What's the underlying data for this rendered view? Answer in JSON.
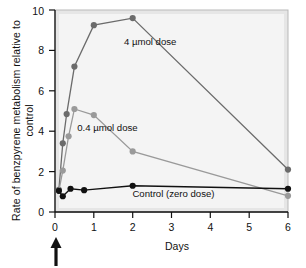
{
  "chart_data": {
    "type": "line",
    "title": "",
    "xlabel": "Days",
    "ylabel": "Rate of benzpyrene metabolism relative to control",
    "xlim": [
      0,
      6
    ],
    "ylim": [
      0,
      10
    ],
    "xticks": [
      "0",
      "1",
      "2",
      "3",
      "4",
      "5",
      "6"
    ],
    "xtick_values": [
      0,
      1,
      2,
      3,
      4,
      5,
      6
    ],
    "yticks": [
      "0",
      "2",
      "4",
      "6",
      "8",
      "10"
    ],
    "ytick_values": [
      0,
      2,
      4,
      6,
      8,
      10
    ],
    "grid": false,
    "legend_position": "inline-annotations",
    "series": [
      {
        "name": "4 µmol dose",
        "color": "#6b6b6b",
        "marker": "circle",
        "x": [
          0.1,
          0.2,
          0.3,
          0.5,
          1.0,
          2.0,
          6.0
        ],
        "y": [
          1.1,
          3.4,
          4.85,
          7.2,
          9.25,
          9.6,
          2.1
        ]
      },
      {
        "name": "0.4 µmol dose",
        "color": "#9a9a9a",
        "marker": "circle",
        "x": [
          0.1,
          0.2,
          0.35,
          0.5,
          1.0,
          2.0,
          6.0
        ],
        "y": [
          1.05,
          2.05,
          3.75,
          5.1,
          4.8,
          3.0,
          0.8
        ]
      },
      {
        "name": "Control (zero dose)",
        "color": "#111111",
        "marker": "circle",
        "x": [
          0.1,
          0.2,
          0.4,
          0.75,
          2.0,
          6.0
        ],
        "y": [
          1.05,
          0.78,
          1.15,
          1.08,
          1.3,
          1.15
        ]
      }
    ],
    "annotations": [
      {
        "text": "4 µmol dose",
        "x": 2.45,
        "y": 8.25
      },
      {
        "text": "0.4 µmol dose",
        "x": 1.35,
        "y": 4.0
      },
      {
        "text": "Control (zero dose)",
        "x": 3.05,
        "y": 0.72
      }
    ],
    "markers": [
      {
        "name": "dose-arrow",
        "shape": "up-arrow",
        "x": 0.05,
        "description": "Arrow below x-axis indicating dose administration at day 0"
      }
    ]
  },
  "colors": {
    "plot_background": "#e9e9e9",
    "plot_inner_background": "#f3f3f3",
    "axis": "#111111",
    "high_dose": "#6b6b6b",
    "low_dose": "#9a9a9a",
    "control": "#111111",
    "page_background": "#ffffff"
  }
}
